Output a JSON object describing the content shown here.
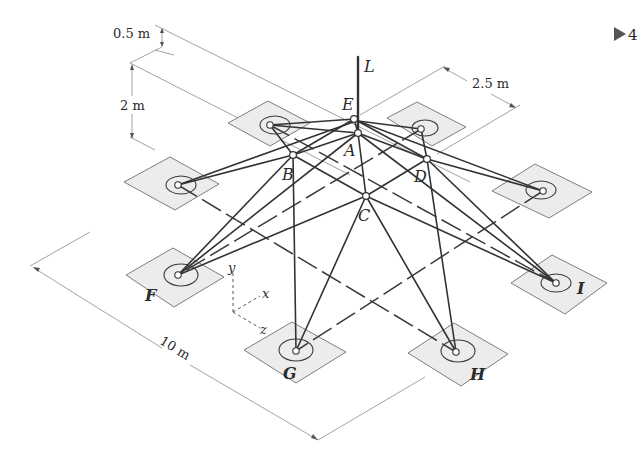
{
  "figure": {
    "type": "isometric space-truss diagram",
    "load_label": "L",
    "nav_marker": "▶ 4",
    "joints": [
      {
        "id": "E",
        "label": "E",
        "x": 354,
        "y": 119
      },
      {
        "id": "A",
        "label": "A",
        "x": 358,
        "y": 133
      },
      {
        "id": "B",
        "label": "B",
        "x": 293,
        "y": 155
      },
      {
        "id": "D",
        "label": "D",
        "x": 427,
        "y": 159
      },
      {
        "id": "C",
        "label": "C",
        "x": 366,
        "y": 196
      }
    ],
    "supports": [
      {
        "id": "TL",
        "label": "",
        "x": 270,
        "y": 125
      },
      {
        "id": "TR",
        "label": "",
        "x": 421,
        "y": 129
      },
      {
        "id": "LF",
        "label": "",
        "x": 178,
        "y": 185
      },
      {
        "id": "RT",
        "label": "",
        "x": 543,
        "y": 191
      },
      {
        "id": "F",
        "label": "F",
        "x": 178,
        "y": 275
      },
      {
        "id": "G",
        "label": "G",
        "x": 296,
        "y": 351
      },
      {
        "id": "H",
        "label": "H",
        "x": 456,
        "y": 352
      },
      {
        "id": "I",
        "label": "I",
        "x": 556,
        "y": 283
      }
    ],
    "dimensions": {
      "top_offset": "0.5 m",
      "height": "2 m",
      "inner_spacing": "2.5 m",
      "base_length": "10 m"
    },
    "axes": {
      "x": "x",
      "y": "y",
      "z": "z"
    }
  }
}
